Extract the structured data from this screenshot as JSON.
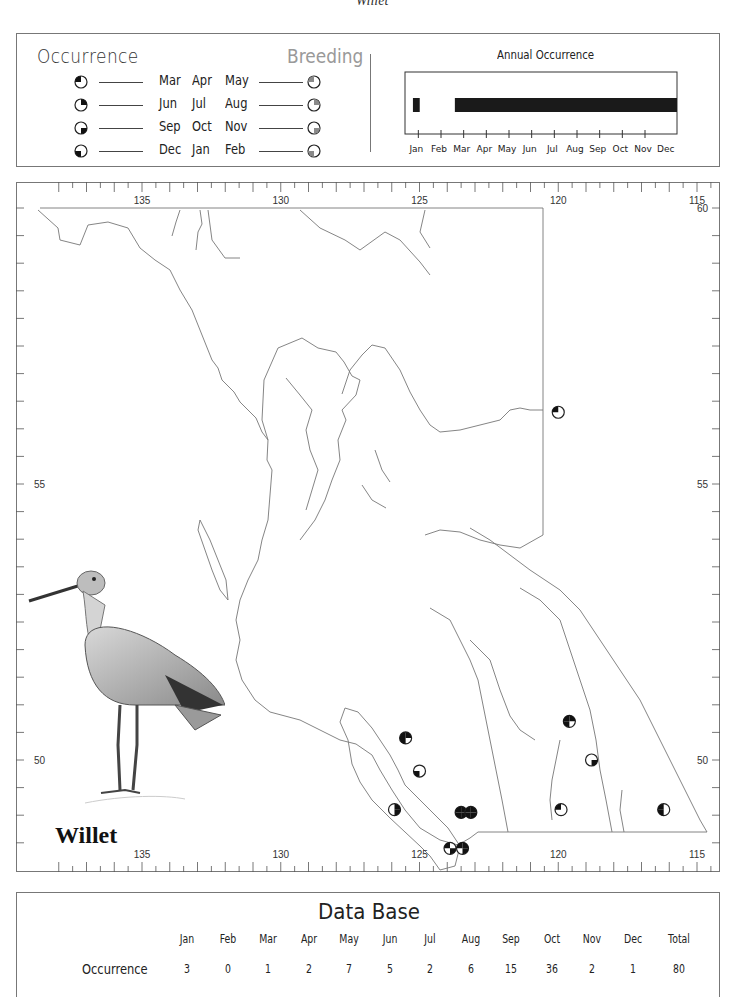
{
  "page": {
    "title": "Willet"
  },
  "legend": {
    "occurrence_label": "Occurrence",
    "breeding_label": "Breeding",
    "seasons": [
      {
        "months": [
          "Mar",
          "Apr",
          "May"
        ],
        "symbol": "quarter-top-left-icon"
      },
      {
        "months": [
          "Jun",
          "Jul",
          "Aug"
        ],
        "symbol": "quarter-top-right-icon"
      },
      {
        "months": [
          "Sep",
          "Oct",
          "Nov"
        ],
        "symbol": "quarter-bottom-right-icon"
      },
      {
        "months": [
          "Dec",
          "Jan",
          "Feb"
        ],
        "symbol": "quarter-bottom-left-icon"
      }
    ]
  },
  "annual_occurrence": {
    "title": "Annual Occurrence",
    "months": [
      "Jan",
      "Feb",
      "Mar",
      "Apr",
      "May",
      "Jun",
      "Jul",
      "Aug",
      "Sep",
      "Oct",
      "Nov",
      "Dec"
    ],
    "present_ranges": [
      [
        0.35,
        0.65
      ],
      [
        2.2,
        12.0
      ]
    ]
  },
  "map": {
    "lon_ticks": [
      "135",
      "130",
      "125",
      "120",
      "115"
    ],
    "lat_ticks": [
      "60",
      "55",
      "50"
    ],
    "species_label": "Willet",
    "records": [
      {
        "lon": 120.0,
        "lat": 56.3,
        "quarters": [
          "top-left"
        ]
      },
      {
        "lon": 125.5,
        "lat": 50.4,
        "quarters": [
          "top-left",
          "top-right",
          "bottom-left"
        ]
      },
      {
        "lon": 125.0,
        "lat": 49.8,
        "quarters": [
          "bottom-left"
        ]
      },
      {
        "lon": 125.9,
        "lat": 49.1,
        "quarters": [
          "top-right",
          "bottom-right"
        ]
      },
      {
        "lon": 123.5,
        "lat": 49.05,
        "quarters": [
          "top-left",
          "top-right",
          "bottom-left",
          "bottom-right"
        ]
      },
      {
        "lon": 123.15,
        "lat": 49.05,
        "quarters": [
          "top-left",
          "top-right",
          "bottom-left",
          "bottom-right"
        ]
      },
      {
        "lon": 123.9,
        "lat": 48.4,
        "quarters": [
          "top-left",
          "bottom-right"
        ]
      },
      {
        "lon": 123.45,
        "lat": 48.4,
        "quarters": [
          "top-left",
          "top-right",
          "bottom-right"
        ]
      },
      {
        "lon": 119.6,
        "lat": 50.7,
        "quarters": [
          "top-left",
          "top-right",
          "bottom-left"
        ]
      },
      {
        "lon": 118.8,
        "lat": 50.0,
        "quarters": [
          "bottom-right"
        ]
      },
      {
        "lon": 119.9,
        "lat": 49.1,
        "quarters": [
          "top-left"
        ]
      },
      {
        "lon": 116.2,
        "lat": 49.1,
        "quarters": [
          "top-left",
          "bottom-left"
        ]
      }
    ]
  },
  "database": {
    "title": "Data Base",
    "columns": [
      "Jan",
      "Feb",
      "Mar",
      "Apr",
      "May",
      "Jun",
      "Jul",
      "Aug",
      "Sep",
      "Oct",
      "Nov",
      "Dec",
      "Total"
    ],
    "row_label": "Occurrence",
    "values": [
      "3",
      "0",
      "1",
      "2",
      "7",
      "5",
      "2",
      "6",
      "15",
      "36",
      "2",
      "1",
      "80"
    ]
  }
}
